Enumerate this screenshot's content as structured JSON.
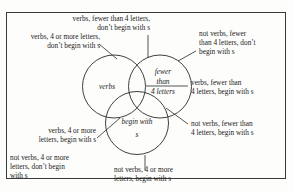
{
  "figure": {
    "kind": "three-set-venn-diagram",
    "universe_border": true
  },
  "circles": [
    {
      "id": "verbs",
      "label": "verbs",
      "position": "left"
    },
    {
      "id": "fewer-than-4-letters",
      "label_line1": "fewer",
      "label_line2": "than",
      "label_line3": "4 letters",
      "position": "right"
    },
    {
      "id": "begin-with-s",
      "label_line1": "begin with",
      "label_line2": "s",
      "position": "bottom"
    }
  ],
  "regions": [
    {
      "id": "verbs-only",
      "text": "verbs, 4 or more letters,\ndon’t begin with s",
      "align": "right"
    },
    {
      "id": "verbs-and-fewer",
      "text": "verbs, fewer than 4 letters,\ndon’t begin with s",
      "align": "right"
    },
    {
      "id": "fewer-only",
      "text": "not verbs, fewer\nthan 4 letters, don’t\nbegin with s",
      "align": "left"
    },
    {
      "id": "verbs-fewer-begin",
      "text": "verbs, fewer than\n4 letters, begin with s",
      "align": "left"
    },
    {
      "id": "fewer-and-begin",
      "text": "not verbs, fewer than\n4 letters, begin with s",
      "align": "left"
    },
    {
      "id": "not-verbs-begin-with-s",
      "text": "not verbs, 4 or more\nletters, begin with s",
      "align": "left"
    },
    {
      "id": "verbs-and-begin",
      "text": "verbs, 4 or more\nletters, begin with s",
      "align": "right"
    },
    {
      "id": "outside-all",
      "text": "not verbs, 4 or more\nletters, don’t begin\nwith s",
      "align": "left"
    }
  ],
  "colors": {
    "stroke": "#2a2a2a",
    "frame": "#3a3a3a",
    "text": "#1b1b1b",
    "background": "#fdfdfc"
  }
}
